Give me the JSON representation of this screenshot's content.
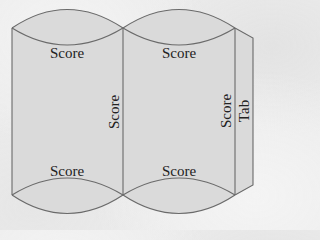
{
  "diagram": {
    "colors": {
      "background": "#ececec",
      "panel_fill": "#dadada",
      "line": "#6a6a6a",
      "text": "#222222"
    },
    "labels": {
      "top_left_score": "Score",
      "top_right_score": "Score",
      "middle_vertical_score": "Score",
      "right_vertical_score": "Score",
      "tab": "Tab",
      "bottom_left_score": "Score",
      "bottom_right_score": "Score"
    }
  }
}
